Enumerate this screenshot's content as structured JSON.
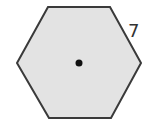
{
  "diagram": {
    "shape": "regular-hexagon",
    "fill_color": "#e3e3e3",
    "stroke_color": "#3a3a3a",
    "stroke_width": 2,
    "vertices": [
      [
        48,
        7
      ],
      [
        110,
        7
      ],
      [
        141,
        63
      ],
      [
        111,
        118
      ],
      [
        49,
        118
      ],
      [
        17,
        63
      ]
    ],
    "center_point": {
      "x": 79,
      "y": 63,
      "radius": 3.5,
      "color": "#111111"
    },
    "side_label": {
      "text": "7",
      "x": 128,
      "y": 37
    }
  }
}
